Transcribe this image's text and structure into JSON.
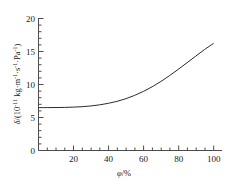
{
  "chart_data": {
    "type": "line",
    "title": "",
    "subtitle": "",
    "xlabel": "φ/%",
    "ylabel": "δ/(10⁻¹¹ kg·m⁻¹·s⁻¹·Pa⁻¹)",
    "ylabel_parts": {
      "symbol": "δ",
      "slash_open": "/(10",
      "exp_minus_eleven": "-11",
      "unit_kg_m": " kg·m",
      "exp_minus_one_a": "-1",
      "unit_mid_dot_s": "·s",
      "exp_minus_one_b": "-1",
      "unit_dot_pa": "·Pa",
      "exp_minus_one_c": "-1",
      "close_paren": ")"
    },
    "xlabel_parts": {
      "symbol": "φ",
      "rest": "/%"
    },
    "xlim": [
      0,
      105
    ],
    "ylim": [
      0,
      20
    ],
    "xticks": [
      20,
      40,
      60,
      80,
      100
    ],
    "xtick_labels": [
      "20",
      "40",
      "60",
      "80",
      "100"
    ],
    "xminor_step": 5,
    "yticks": [
      0,
      5,
      10,
      15,
      20
    ],
    "ytick_labels": [
      "0",
      "5",
      "10",
      "15",
      "20"
    ],
    "yminor_step": 1,
    "grid": false,
    "legend": null,
    "spines": [
      "left",
      "bottom"
    ],
    "tick_direction": "in",
    "series": [
      {
        "name": "water vapour permeability",
        "color": "#2b2b2b",
        "x": [
          0,
          5,
          10,
          15,
          20,
          25,
          30,
          35,
          40,
          45,
          50,
          55,
          60,
          65,
          70,
          75,
          80,
          85,
          90,
          95,
          100
        ],
        "y": [
          6.5,
          6.5,
          6.51,
          6.53,
          6.57,
          6.64,
          6.75,
          6.92,
          7.15,
          7.45,
          7.85,
          8.35,
          8.95,
          9.65,
          10.45,
          11.35,
          12.3,
          13.3,
          14.3,
          15.3,
          16.2
        ]
      }
    ]
  }
}
